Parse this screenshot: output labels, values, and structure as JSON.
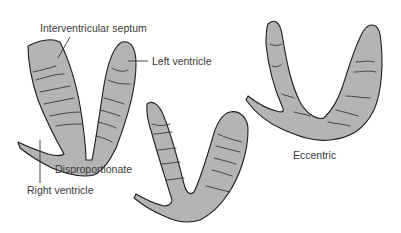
{
  "figure": {
    "colors": {
      "background": "#ffffff",
      "tissue_fill": "#b4b4b4",
      "outline": "#1e1e1e",
      "text": "#3a3a3a"
    },
    "labels": {
      "interventricular_septum": "Interventricular septum",
      "left_ventricle": "Left ventricle",
      "right_ventricle": "Right ventricle",
      "disproportionate": "Disproportionate",
      "eccentric": "Eccentric"
    },
    "panels": [
      {
        "id": "disproportionate",
        "caption": "Disproportionate",
        "position": "left"
      },
      {
        "id": "middle",
        "caption": "",
        "position": "center"
      },
      {
        "id": "eccentric",
        "caption": "Eccentric",
        "position": "right"
      }
    ]
  }
}
